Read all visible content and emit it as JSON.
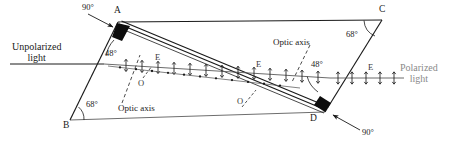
{
  "figure": {
    "type": "optics-ray-diagram",
    "colors": {
      "stroke": "#1a1a1a",
      "background": "#ffffff",
      "gray_text": "#8a8a8a",
      "ray_gray": "#5a5a5a",
      "edge_gray": "#6e6e6e"
    }
  },
  "vertices": {
    "a": {
      "label": "A",
      "x": 118,
      "y": 22
    },
    "b": {
      "label": "B",
      "x": 70,
      "y": 120
    },
    "c": {
      "label": "C",
      "x": 382,
      "y": 20
    },
    "d": {
      "label": "D",
      "x": 325,
      "y": 112
    }
  },
  "angles": {
    "a_right": {
      "value": "90°"
    },
    "a_inner": {
      "value": "48°"
    },
    "b_inner": {
      "value": "68°"
    },
    "c_inner": {
      "value": "68°"
    },
    "d_inner": {
      "value": "48°"
    },
    "d_right": {
      "value": "90°"
    }
  },
  "beams": {
    "input": {
      "line1": "Unpolarized",
      "line2": "light"
    },
    "output": {
      "line1": "Polarized",
      "line2": "light"
    }
  },
  "ray_labels": {
    "e_inside_left": "E",
    "e_inside_right": "E",
    "e_outside": "E",
    "o_upper": "O",
    "o_lower": "O"
  },
  "optic_axis": {
    "bottom_left": "Optic axis",
    "top_right": "Optic axis"
  }
}
